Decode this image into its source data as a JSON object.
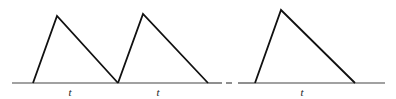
{
  "diagram": {
    "stroke_color": "#111111",
    "axis_color": "#444444",
    "baseline_y": 83,
    "axis": {
      "x1": 12,
      "x2": 385
    },
    "axis_break": {
      "segments": [
        [
          208,
          222
        ],
        [
          226,
          232
        ],
        [
          238,
          255
        ]
      ]
    },
    "pulses": [
      {
        "start": [
          33,
          83
        ],
        "peak": [
          57,
          16
        ],
        "end": [
          118,
          83
        ]
      },
      {
        "start": [
          118,
          83
        ],
        "peak": [
          143,
          14
        ],
        "end": [
          208,
          83
        ]
      },
      {
        "start": [
          255,
          83
        ],
        "peak": [
          281,
          10
        ],
        "end": [
          355,
          83
        ]
      }
    ],
    "labels": [
      {
        "text": "t",
        "x": 70,
        "y": 96
      },
      {
        "text": "t",
        "x": 158,
        "y": 96
      },
      {
        "text": "t",
        "x": 302,
        "y": 96
      }
    ]
  }
}
